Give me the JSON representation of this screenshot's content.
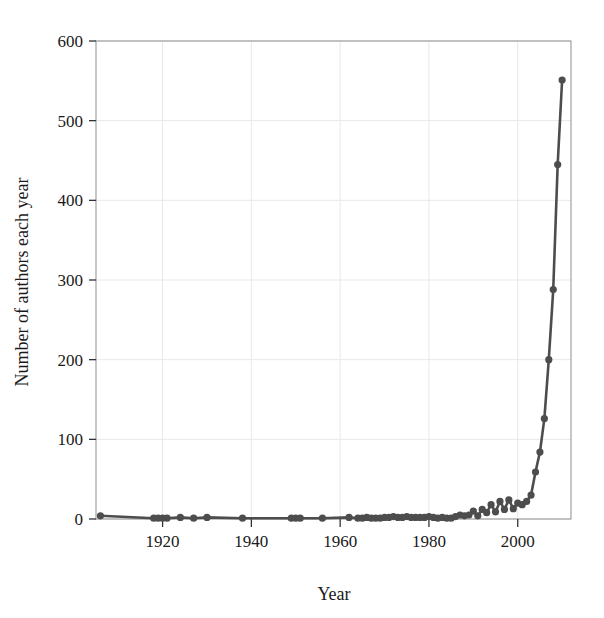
{
  "chart_data": {
    "type": "line",
    "title": "",
    "xlabel": "Year",
    "ylabel": "Number of authors each year",
    "xlim": [
      1905,
      2012
    ],
    "ylim": [
      0,
      600
    ],
    "xticks": [
      1920,
      1940,
      1960,
      1980,
      2000
    ],
    "yticks": [
      0,
      100,
      200,
      300,
      400,
      500,
      600
    ],
    "grid": true,
    "legend": "none",
    "marker": "circle",
    "line_color": "#4d4d4d",
    "marker_color": "#4d4d4d",
    "grid_color": "#e8e8e8",
    "axis_color": "#999999",
    "text_color": "#1a1a1a",
    "series": [
      {
        "name": "Number of authors each year",
        "x": [
          1906,
          1918,
          1919,
          1920,
          1921,
          1924,
          1927,
          1930,
          1938,
          1949,
          1950,
          1951,
          1956,
          1962,
          1964,
          1965,
          1966,
          1967,
          1968,
          1969,
          1970,
          1971,
          1972,
          1973,
          1974,
          1975,
          1976,
          1977,
          1978,
          1979,
          1980,
          1981,
          1982,
          1983,
          1984,
          1985,
          1986,
          1987,
          1988,
          1989,
          1990,
          1991,
          1992,
          1993,
          1994,
          1995,
          1996,
          1997,
          1998,
          1999,
          2000,
          2001,
          2002,
          2003,
          2004,
          2005,
          2006,
          2007,
          2008,
          2009,
          2010
        ],
        "y": [
          4,
          1,
          1,
          1,
          1,
          2,
          1,
          2,
          1,
          1,
          1,
          1,
          1,
          2,
          1,
          1,
          2,
          1,
          1,
          1,
          2,
          2,
          3,
          2,
          2,
          3,
          2,
          2,
          2,
          2,
          3,
          2,
          1,
          2,
          1,
          1,
          3,
          5,
          4,
          5,
          10,
          4,
          12,
          8,
          18,
          9,
          22,
          12,
          24,
          13,
          20,
          18,
          22,
          30,
          59,
          84,
          126,
          200,
          288,
          445,
          551
        ]
      }
    ]
  },
  "axis": {
    "x_tick_labels": [
      "1920",
      "1940",
      "1960",
      "1980",
      "2000"
    ],
    "y_tick_labels": [
      "0",
      "100",
      "200",
      "300",
      "400",
      "500",
      "600"
    ],
    "x_title": "Year",
    "y_title": "Number of authors each year"
  }
}
